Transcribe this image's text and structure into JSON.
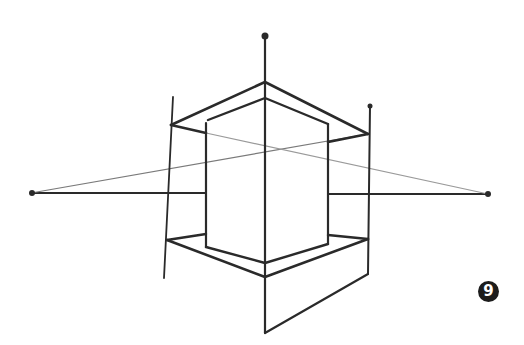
{
  "figure": {
    "step_badge": "9",
    "colors": {
      "stroke": "#2a2a2a",
      "light_stroke": "#7a7a7a",
      "badge_bg": "#1c1c1c",
      "background": "#ffffff"
    },
    "vanishing_points": {
      "left": [
        31,
        193
      ],
      "right": [
        488,
        194
      ],
      "top": [
        265,
        36
      ]
    }
  }
}
